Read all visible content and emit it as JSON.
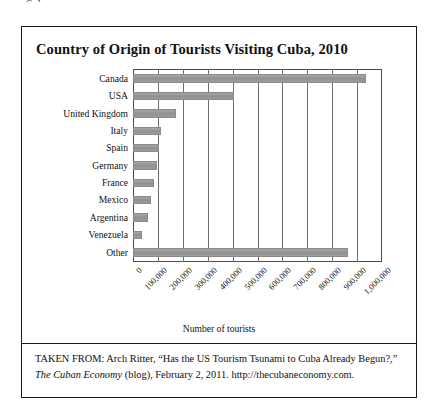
{
  "page_header": "Cuba",
  "figure": {
    "title": "Country of Origin of Tourists Visiting Cuba, 2010",
    "source": {
      "line1_prefix": "TAKEN FROM: Arch Ritter, “Has the US Tourism Tsunami to Cuba",
      "line2_a": "Already Begun?,” ",
      "line2_italic": "The Cuban Economy",
      "line2_b": " (blog), February 2, 2011.",
      "line3": "http://thecubaneconomy.com."
    }
  },
  "chart_data": {
    "type": "bar",
    "orientation": "horizontal",
    "title": "Country of Origin of Tourists Visiting Cuba, 2010",
    "xlabel": "Number of tourists",
    "ylabel": "",
    "categories": [
      "Canada",
      "USA",
      "United Kingdom",
      "Italy",
      "Spain",
      "Germany",
      "France",
      "Mexico",
      "Argentina",
      "Venezuela",
      "Other"
    ],
    "values": [
      935000,
      407000,
      172000,
      112000,
      105000,
      95000,
      85000,
      72000,
      60000,
      35000,
      863000
    ],
    "xlim": [
      0,
      1000000
    ],
    "xticks": [
      0,
      100000,
      200000,
      300000,
      400000,
      500000,
      600000,
      700000,
      800000,
      900000,
      1000000
    ],
    "xtick_labels": [
      "0",
      "100,000",
      "200,000",
      "300,000",
      "400,000",
      "500,000",
      "600,000",
      "700,000",
      "800,000",
      "900,000",
      "1,000,000"
    ],
    "grid": "vertical",
    "legend": null,
    "bar_color": "#9a9a9a",
    "axis_color": "#4a4a4a",
    "grid_color": "#6e6e6e"
  }
}
